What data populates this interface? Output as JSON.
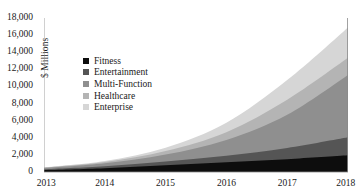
{
  "chart_data": {
    "type": "area",
    "stacked": true,
    "title": "",
    "subtitle": "",
    "xlabel": "",
    "ylabel": "$ Millions",
    "categories": [
      "2013",
      "2014",
      "2015",
      "2016",
      "2017",
      "2018"
    ],
    "x": [
      2013,
      2014,
      2015,
      2016,
      2017,
      2018
    ],
    "xlim": [
      2013,
      2018
    ],
    "ylim": [
      0,
      18000
    ],
    "yticks": [
      0,
      2000,
      4000,
      6000,
      8000,
      10000,
      12000,
      14000,
      16000,
      18000
    ],
    "ytick_labels": [
      "0",
      "2,000",
      "4,000",
      "6,000",
      "8,000",
      "10,000",
      "12,000",
      "14,000",
      "16,000",
      "18,000"
    ],
    "xtick_labels": [
      "2013",
      "2014",
      "2015",
      "2016",
      "2017",
      "2018"
    ],
    "grid": false,
    "legend_position": "inside-upper-left",
    "series": [
      {
        "name": "Fitness",
        "color": "#0d0d0d",
        "values": [
          220,
          450,
          800,
          1150,
          1500,
          1950
        ]
      },
      {
        "name": "Entertainment",
        "color": "#555555",
        "values": [
          110,
          230,
          420,
          750,
          1300,
          2100
        ]
      },
      {
        "name": "Multi-Function",
        "color": "#8f8f8f",
        "values": [
          120,
          330,
          820,
          1850,
          3900,
          7300
        ]
      },
      {
        "name": "Healthcare",
        "color": "#b4b4b4",
        "values": [
          60,
          150,
          400,
          900,
          1750,
          2000
        ]
      },
      {
        "name": "Enterprise",
        "color": "#d6d6d6",
        "values": [
          50,
          140,
          400,
          1100,
          2300,
          3550
        ]
      }
    ],
    "totals": [
      560,
      1300,
      2840,
      5750,
      10750,
      16900
    ]
  },
  "legend": {
    "items": [
      {
        "label": "Fitness",
        "color": "#0d0d0d"
      },
      {
        "label": "Entertainment",
        "color": "#555555"
      },
      {
        "label": "Multi-Function",
        "color": "#8f8f8f"
      },
      {
        "label": "Healthcare",
        "color": "#b4b4b4"
      },
      {
        "label": "Enterprise",
        "color": "#d6d6d6"
      }
    ]
  },
  "axes": {
    "y_title": "$ Millions",
    "axis_color": "#8a8a8a"
  }
}
